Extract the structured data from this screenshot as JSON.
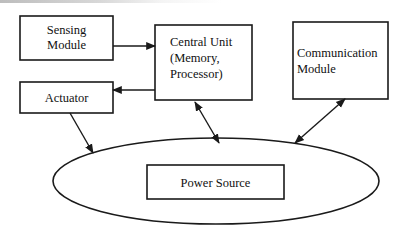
{
  "diagram": {
    "nodes": {
      "sensing": {
        "lines": [
          "Sensing",
          "Module"
        ]
      },
      "central": {
        "lines": [
          "Central Unit",
          "(Memory,",
          "Processor)"
        ]
      },
      "communication": {
        "lines": [
          "Communication",
          "Module"
        ]
      },
      "actuator": {
        "lines": [
          "Actuator"
        ]
      },
      "power": {
        "lines": [
          "Power Source"
        ]
      }
    },
    "edges": [
      {
        "from": "Sensing Module",
        "to": "Central Unit",
        "direction": "one-way"
      },
      {
        "from": "Central Unit",
        "to": "Actuator",
        "direction": "one-way"
      },
      {
        "from": "Actuator",
        "to": "Power Source",
        "direction": "one-way"
      },
      {
        "from": "Central Unit",
        "to": "Power Source",
        "direction": "two-way"
      },
      {
        "from": "Communication Module",
        "to": "Power Source",
        "direction": "two-way"
      }
    ],
    "colors": {
      "stroke": "#1a1a1a",
      "background": "#ffffff"
    }
  }
}
